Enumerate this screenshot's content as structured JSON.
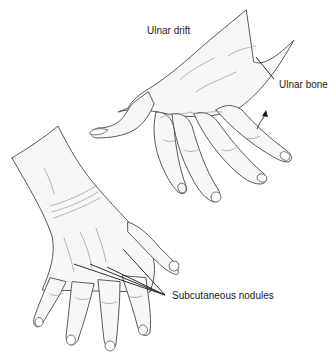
{
  "figure": {
    "labels": {
      "ulnar_drift": "Ulnar drift",
      "ulnar_bone": "Ulnar bone",
      "subcutaneous_nodules": "Subcutaneous nodules"
    },
    "colors": {
      "background": "#ffffff",
      "outline": "#5a5a5a",
      "label_text": "#222222",
      "leader_line": "#1a1a1a"
    }
  }
}
